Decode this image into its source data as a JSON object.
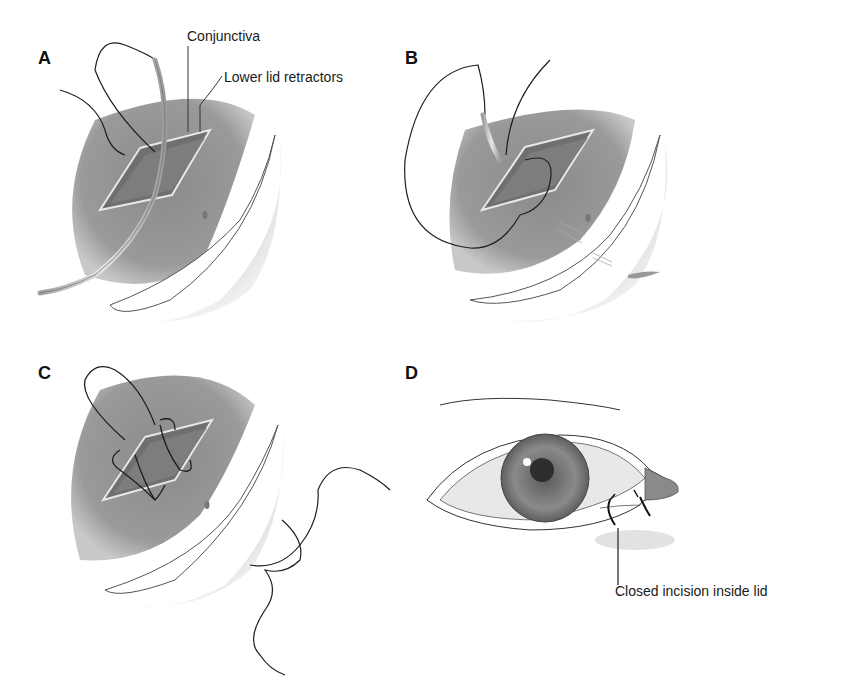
{
  "figure": {
    "panels": [
      {
        "letter": "A",
        "labels": [
          "Conjunctiva",
          "Lower lid retractors"
        ]
      },
      {
        "letter": "B",
        "labels": []
      },
      {
        "letter": "C",
        "labels": []
      },
      {
        "letter": "D",
        "labels": [
          "Closed incision inside lid"
        ]
      }
    ]
  },
  "colors": {
    "tissue": "#8c8c8c",
    "tissue_dark": "#6e6e6e",
    "suture": "#1e1e1e",
    "rim": "#d9d9d9",
    "iris": "#7a7a7a"
  }
}
